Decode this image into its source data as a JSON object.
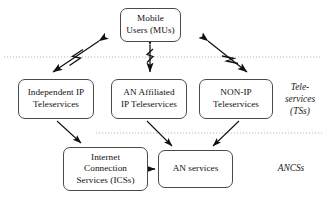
{
  "figure": {
    "kind": "block-diagram",
    "background": "#ffffff",
    "line_color": "#1a1a1a",
    "divider_color": "#b9b9b9",
    "box_border_color": "#4a4a4a"
  },
  "nodes": [
    {
      "id": "mobile-users",
      "lines": [
        "Mobile",
        "Users (MUs)"
      ],
      "x": 120,
      "y": 8,
      "w": 61,
      "h": 34
    },
    {
      "id": "independent-ip-teleservices",
      "lines": [
        "Independent IP",
        "Teleservices"
      ],
      "x": 18,
      "y": 79,
      "w": 76,
      "h": 40
    },
    {
      "id": "an-affiliated-ip-teleservices",
      "lines": [
        "AN Affiliated",
        "IP Teleservices"
      ],
      "x": 111,
      "y": 79,
      "w": 76,
      "h": 40
    },
    {
      "id": "non-ip-teleservices",
      "lines": [
        "NON-IP",
        "Teleservices"
      ],
      "x": 199,
      "y": 79,
      "w": 74,
      "h": 40
    },
    {
      "id": "internet-connection-services",
      "lines": [
        "Internet",
        "Connection",
        "Services (ICSs)"
      ],
      "x": 63,
      "y": 147,
      "w": 85,
      "h": 44
    },
    {
      "id": "an-services",
      "lines": [
        "AN services"
      ],
      "x": 158,
      "y": 150,
      "w": 75,
      "h": 38
    }
  ],
  "side_labels": [
    {
      "id": "teleservices-zone-label",
      "lines": [
        "Tele-",
        "services",
        "(TSs)"
      ],
      "x": 277,
      "y": 82,
      "w": 46
    },
    {
      "id": "ancss-zone-label",
      "lines": [
        "ANCSs"
      ],
      "x": 265,
      "y": 163,
      "w": 52
    }
  ],
  "dividers": [
    {
      "id": "divider-upper",
      "x1": 4,
      "y1": 57,
      "x2": 322,
      "y2": 57
    },
    {
      "id": "divider-lower",
      "x1": 96,
      "y1": 133,
      "x2": 322,
      "y2": 133
    }
  ],
  "connectors": [
    {
      "id": "mu-to-independent-ip",
      "from": "mobile-users",
      "to": "independent-ip-teleservices",
      "style": "double-headed-wireless",
      "x1": 100,
      "y1": 40,
      "x2": 52,
      "y2": 73
    },
    {
      "id": "mu-to-an-affiliated-ip",
      "from": "mobile-users",
      "to": "an-affiliated-ip-teleservices",
      "style": "double-headed-wireless",
      "x1": 150,
      "y1": 45,
      "x2": 150,
      "y2": 72
    },
    {
      "id": "mu-to-non-ip",
      "from": "mobile-users",
      "to": "non-ip-teleservices",
      "style": "double-headed-wireless",
      "x1": 207,
      "y1": 40,
      "x2": 246,
      "y2": 73
    },
    {
      "id": "independent-ip-to-ics",
      "from": "independent-ip-teleservices",
      "to": "internet-connection-services",
      "style": "single-arrow",
      "x1": 58,
      "y1": 121,
      "x2": 82,
      "y2": 144
    },
    {
      "id": "an-affiliated-ip-to-an-services",
      "from": "an-affiliated-ip-teleservices",
      "to": "an-services",
      "style": "single-arrow",
      "x1": 148,
      "y1": 121,
      "x2": 172,
      "y2": 147
    },
    {
      "id": "non-ip-to-an-services",
      "from": "non-ip-teleservices",
      "to": "an-services",
      "style": "single-arrow",
      "x1": 238,
      "y1": 121,
      "x2": 212,
      "y2": 147
    },
    {
      "id": "ics-to-an-services",
      "from": "internet-connection-services",
      "to": "an-services",
      "style": "single-arrow",
      "x1": 150,
      "y1": 169,
      "x2": 156,
      "y2": 169
    }
  ]
}
